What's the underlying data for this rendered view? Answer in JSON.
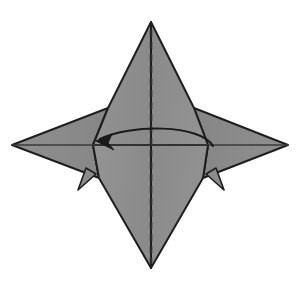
{
  "figure": {
    "type": "origami-step-diagram",
    "background_color": "#ffffff",
    "paper_fill_color": "#8c8c8c",
    "paper_fill_shadow_color": "#7e7e7e",
    "edge_stroke_color": "#1e1e1e",
    "crease_stroke_color": "#2b2b2b",
    "arrow_color": "#1a1a1a",
    "canvas": {
      "width": 305,
      "height": 285
    }
  },
  "geometry": {
    "top_apex": {
      "x": 151,
      "y": 22
    },
    "bottom_apex": {
      "x": 151,
      "y": 268
    },
    "left_tip": {
      "x": 12,
      "y": 145
    },
    "right_tip": {
      "x": 288,
      "y": 145
    },
    "left_inner_vertex": {
      "x": 93,
      "y": 145
    },
    "right_inner_vertex": {
      "x": 208,
      "y": 145
    },
    "left_upper_shoulder": {
      "x": 108,
      "y": 108
    },
    "right_upper_shoulder": {
      "x": 194,
      "y": 108
    },
    "left_lower_shoulder": {
      "x": 99,
      "y": 178
    },
    "right_lower_shoulder": {
      "x": 203,
      "y": 178
    },
    "left_spike_tip": {
      "x": 78,
      "y": 190
    },
    "right_spike_tip": {
      "x": 224,
      "y": 190
    }
  },
  "shapes": {
    "top_point_label": "top-point",
    "bottom_point_label": "bottom-point",
    "left_wing_label": "left-wing",
    "right_wing_label": "right-wing",
    "left_spike_label": "left-spike",
    "right_spike_label": "right-spike",
    "top_point_path": "M151,22 L108,108 L93,145 L151,145 Z",
    "top_point_right_path": "M151,22 L194,108 L208,145 L151,145 Z",
    "bottom_point_path": "M151,268 L99,178 L93,145 L151,145 Z",
    "bottom_point_right_path": "M151,268 L203,178 L208,145 L151,145 Z",
    "left_wing_path": "M12,145 L108,108 L93,145 L99,178 Z",
    "right_wing_path": "M288,145 L194,108 L208,145 L203,178 Z",
    "left_spike_path": "M78,190 L86,168 L96,174 Z",
    "right_spike_path": "M224,190 L216,168 L206,174 Z"
  },
  "creases": {
    "center_fold_label": "center-vertical-valley-fold",
    "center_fold_style": "dashed",
    "center_fold_x": 151,
    "center_fold_y_top": 30,
    "center_fold_y_bottom": 264,
    "center_fold_dash_pattern": "7 5",
    "horizontal_crease_label": "horizontal-crease-line",
    "horizontal_crease_path": "M12,145 L288,145"
  },
  "arrow": {
    "label": "fold-over-arrow",
    "direction": "right-to-left",
    "path": "M213,146 C200,124 130,124 100,139",
    "head_tip": {
      "x": 96,
      "y": 141
    },
    "head_path": "M96,141 L112,134 L108,143 L114,150 Z",
    "stroke_width": 2
  }
}
